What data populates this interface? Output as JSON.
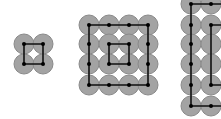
{
  "colors": {
    "background": "#ffffff",
    "circle_fill": "#a3a3a3",
    "circle_stroke": "#8a8a8a",
    "line": "#111111",
    "node": "#000000"
  },
  "radius": 10,
  "grids": [
    {
      "name": "grid-2x2",
      "xs": [
        24,
        43
      ],
      "ys": [
        44,
        64
      ],
      "paths": [
        [
          [
            24,
            44
          ],
          [
            43,
            44
          ],
          [
            43,
            64
          ],
          [
            24,
            64
          ],
          [
            24,
            44
          ]
        ]
      ],
      "nodes": [
        [
          24,
          44
        ],
        [
          43,
          44
        ],
        [
          24,
          64
        ],
        [
          43,
          64
        ]
      ]
    },
    {
      "name": "grid-4x4",
      "xs": [
        89,
        109,
        129,
        148
      ],
      "ys": [
        25,
        44,
        64,
        85
      ],
      "paths": [
        [
          [
            89,
            25
          ],
          [
            148,
            25
          ],
          [
            148,
            85
          ],
          [
            89,
            85
          ],
          [
            89,
            25
          ]
        ],
        [
          [
            109,
            44
          ],
          [
            129,
            44
          ],
          [
            129,
            64
          ],
          [
            109,
            64
          ],
          [
            109,
            44
          ]
        ]
      ],
      "nodes": [
        [
          89,
          25
        ],
        [
          109,
          25
        ],
        [
          129,
          25
        ],
        [
          148,
          25
        ],
        [
          89,
          44
        ],
        [
          148,
          44
        ],
        [
          89,
          64
        ],
        [
          148,
          64
        ],
        [
          89,
          85
        ],
        [
          109,
          85
        ],
        [
          129,
          85
        ],
        [
          148,
          85
        ],
        [
          109,
          44
        ],
        [
          129,
          44
        ],
        [
          109,
          64
        ],
        [
          129,
          64
        ]
      ]
    },
    {
      "name": "grid-partial",
      "xs": [
        191,
        211
      ],
      "ys": [
        4,
        25,
        44,
        64,
        85,
        106
      ],
      "paths": [
        [
          [
            230,
            4
          ],
          [
            191,
            4
          ],
          [
            191,
            106
          ],
          [
            230,
            106
          ]
        ],
        [
          [
            230,
            25
          ],
          [
            211,
            25
          ],
          [
            211,
            85
          ],
          [
            230,
            85
          ]
        ]
      ],
      "nodes": [
        [
          191,
          4
        ],
        [
          211,
          4
        ],
        [
          191,
          25
        ],
        [
          191,
          44
        ],
        [
          191,
          64
        ],
        [
          191,
          85
        ],
        [
          191,
          106
        ],
        [
          211,
          106
        ],
        [
          211,
          25
        ],
        [
          211,
          85
        ]
      ]
    }
  ]
}
